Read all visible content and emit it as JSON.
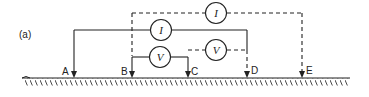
{
  "figure": {
    "panel_label": "(a)",
    "electrodes": [
      {
        "label": "A",
        "x": 74
      },
      {
        "label": "B",
        "x": 132
      },
      {
        "label": "C",
        "x": 188
      },
      {
        "label": "D",
        "x": 247
      },
      {
        "label": "E",
        "x": 302
      }
    ],
    "meters": [
      {
        "symbol": "I",
        "type": "current",
        "style": "solid",
        "between": [
          "A",
          "D"
        ]
      },
      {
        "symbol": "V",
        "type": "voltage",
        "style": "solid",
        "between": [
          "B",
          "C"
        ]
      },
      {
        "symbol": "I",
        "type": "current",
        "style": "dashed",
        "between": [
          "B",
          "E"
        ]
      },
      {
        "symbol": "V",
        "type": "voltage",
        "style": "dashed",
        "between": [
          "C",
          "D"
        ]
      }
    ],
    "colors": {
      "line": "#222222",
      "background": "#ffffff"
    }
  }
}
